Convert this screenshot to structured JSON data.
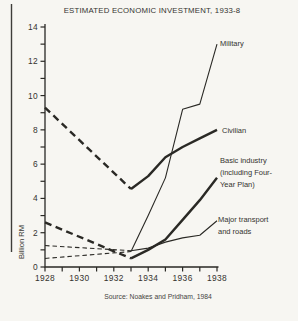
{
  "page": {
    "title": "ESTIMATED ECONOMIC INVESTMENT, 1933-8",
    "source": "Source: Noakes and Pridham, 1984",
    "background": "#f7f6f2",
    "ink": "#2a2925"
  },
  "chart_data": {
    "type": "line",
    "title": "ESTIMATED ECONOMIC INVESTMENT, 1933-8",
    "xlabel": "",
    "ylabel": "Billion RM",
    "source": "Source: Noakes and Pridham, 1984",
    "xlim": [
      1928,
      1938
    ],
    "ylim": [
      0,
      14
    ],
    "grid": false,
    "legend_position": "inline-right",
    "x_tick_step": 1,
    "x_label_step": 2,
    "y_tick_step": 1,
    "y_label_step": 2,
    "x_tick_labels": [
      "1928",
      "1930",
      "1932",
      "1934",
      "1936",
      "1938"
    ],
    "y_tick_labels": [
      "0",
      "2",
      "4",
      "6",
      "8",
      "10",
      "12",
      "14"
    ],
    "note": "dashed segments = pre-1933 estimates, solid segments = 1933-8",
    "series": [
      {
        "name": "Military",
        "weight": "thin",
        "dashed_segment": {
          "x": [
            1928,
            1933
          ],
          "values": [
            0.5,
            0.9
          ]
        },
        "solid_segment": {
          "x": [
            1933,
            1934,
            1935,
            1936,
            1937,
            1938
          ],
          "values": [
            0.9,
            3.0,
            5.2,
            9.2,
            9.5,
            13.0
          ]
        },
        "label": {
          "lines": [
            "Military"
          ],
          "x": 220,
          "y": 46
        }
      },
      {
        "name": "Civilian",
        "weight": "thick",
        "dashed_segment": {
          "x": [
            1928,
            1933
          ],
          "values": [
            9.3,
            4.55
          ]
        },
        "solid_segment": {
          "x": [
            1933,
            1934,
            1935,
            1936,
            1937,
            1938
          ],
          "values": [
            4.55,
            5.3,
            6.4,
            7.0,
            7.5,
            8.0
          ]
        },
        "label": {
          "lines": [
            "Civilian"
          ],
          "x": 222,
          "y": 133
        }
      },
      {
        "name": "Basic industry (including Four-Year Plan)",
        "weight": "thick",
        "dashed_segment": {
          "x": [
            1928,
            1933
          ],
          "values": [
            2.6,
            0.5
          ]
        },
        "solid_segment": {
          "x": [
            1933,
            1934,
            1935,
            1936,
            1937,
            1938
          ],
          "values": [
            0.5,
            1.0,
            1.6,
            2.75,
            3.9,
            5.2
          ]
        },
        "label": {
          "lines": [
            "Basic industry",
            "(including Four-",
            "Year Plan)"
          ],
          "x": 220,
          "y": 163
        }
      },
      {
        "name": "Major transport and roads",
        "weight": "thin",
        "dashed_segment": {
          "x": [
            1928,
            1933
          ],
          "values": [
            1.25,
            0.95
          ]
        },
        "solid_segment": {
          "x": [
            1933,
            1934,
            1935,
            1936,
            1937,
            1938
          ],
          "values": [
            0.95,
            1.1,
            1.45,
            1.7,
            1.85,
            2.7
          ]
        },
        "label": {
          "lines": [
            "Major transport",
            "and roads"
          ],
          "x": 218,
          "y": 222
        }
      }
    ]
  }
}
